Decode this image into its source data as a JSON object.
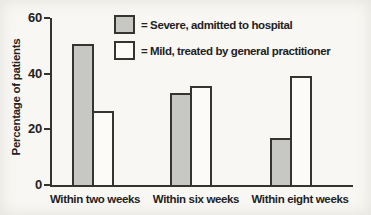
{
  "chart_data": {
    "type": "bar",
    "title": "",
    "xlabel": "",
    "ylabel": "Percentage of patients",
    "ylim": [
      0,
      60
    ],
    "yticks": [
      0,
      20,
      40,
      60
    ],
    "grid": false,
    "legend_position": "top-center-inside",
    "categories": [
      "Within two weeks",
      "Within six weeks",
      "Within eight weeks"
    ],
    "series": [
      {
        "name": "Severe, admitted to hospital",
        "color": "#c7c7c3",
        "values": [
          50,
          32.5,
          16
        ]
      },
      {
        "name": "Mild, treated by general practitioner",
        "color": "#fcfbf7",
        "values": [
          26,
          35,
          38.5
        ]
      }
    ]
  },
  "legend": {
    "items": [
      {
        "swatch": "severe-swatch",
        "text": "= Severe, admitted to hospital"
      },
      {
        "swatch": "mild-swatch",
        "text": "= Mild, treated by general practitioner"
      }
    ]
  },
  "colors": {
    "outline": "#35342f",
    "text": "#23221f",
    "bar_severe": "#c7c7c3",
    "bar_mild": "#fcfbf7",
    "background": "#f8f7f3"
  }
}
